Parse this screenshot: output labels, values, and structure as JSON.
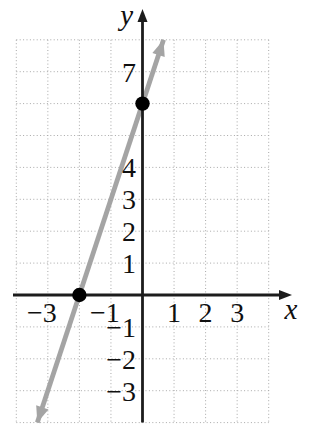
{
  "figure": {
    "background": "#ffffff"
  },
  "chart_data": {
    "type": "line",
    "title": "",
    "xlabel": "x",
    "ylabel": "y",
    "axis_range": {
      "x_min": -4,
      "x_max": 4,
      "y_min": -4,
      "y_max": 8
    },
    "grid": {
      "visible": true,
      "style": "dotted",
      "spacing": 1
    },
    "x_ticks": [
      {
        "value": -3,
        "label": "−3"
      },
      {
        "value": -1,
        "label": "−1"
      },
      {
        "value": 1,
        "label": "1"
      },
      {
        "value": 2,
        "label": "2"
      },
      {
        "value": 3,
        "label": "3"
      }
    ],
    "y_ticks": [
      {
        "value": 7,
        "label": "7"
      },
      {
        "value": 4,
        "label": "4"
      },
      {
        "value": 3,
        "label": "3"
      },
      {
        "value": 2,
        "label": "2"
      },
      {
        "value": 1,
        "label": "1"
      },
      {
        "value": -1,
        "label": "−1"
      },
      {
        "value": -2,
        "label": "−2"
      },
      {
        "value": -3,
        "label": "−3"
      }
    ],
    "series": [
      {
        "name": "line",
        "slope": 3,
        "y_intercept": 6,
        "x_intercept": -2,
        "draw_from": [
          -3.3333,
          -4
        ],
        "draw_to": [
          0.6667,
          8
        ],
        "arrows": "both"
      }
    ],
    "marked_points": [
      [
        -2,
        0
      ],
      [
        0,
        6
      ]
    ],
    "colors": {
      "line": "#a4a4a4",
      "axis": "#1c1c1c",
      "grid": "#a8a8a8",
      "point": "#000000",
      "text": "#101010"
    }
  }
}
